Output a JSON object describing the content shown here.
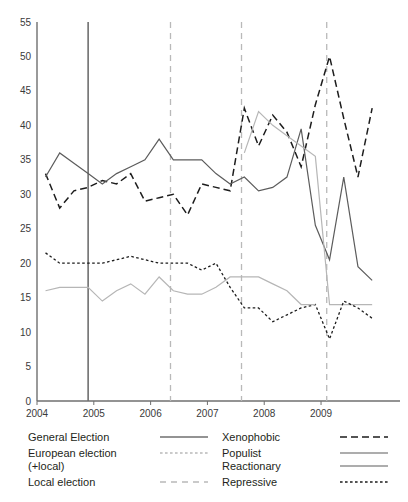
{
  "chart_data": {
    "type": "line",
    "title": "",
    "xlabel": "",
    "ylabel": "",
    "ylim": [
      0,
      55
    ],
    "xlim": [
      2004.0,
      2009.95
    ],
    "ytick_labels": [
      "0",
      "5",
      "10",
      "15",
      "20",
      "25",
      "30",
      "35",
      "40",
      "45",
      "50",
      "55"
    ],
    "ytick_values": [
      0,
      5,
      10,
      15,
      20,
      25,
      30,
      35,
      40,
      45,
      50,
      55
    ],
    "xtick_labels": [
      "2004",
      "2005",
      "2006",
      "2007",
      "2008",
      "2009"
    ],
    "xtick_values": [
      2004,
      2005,
      2006,
      2007,
      2008,
      2009
    ],
    "grid": false,
    "legend_position": "below-plot",
    "x": [
      2004.15,
      2004.4,
      2004.65,
      2004.9,
      2005.15,
      2005.4,
      2005.65,
      2005.9,
      2006.15,
      2006.4,
      2006.65,
      2006.9,
      2007.15,
      2007.4,
      2007.65,
      2007.9,
      2008.15,
      2008.4,
      2008.65,
      2008.9,
      2009.15,
      2009.4,
      2009.65,
      2009.9
    ],
    "series": [
      {
        "name": "Xenophobic",
        "style": "dashed",
        "color": "#1d1d1d",
        "values": [
          33.0,
          28.0,
          30.5,
          31.0,
          32.0,
          31.5,
          33.0,
          29.0,
          29.5,
          30.0,
          27.0,
          31.5,
          31.0,
          30.5,
          42.5,
          37.0,
          41.5,
          39.0,
          34.0,
          43.0,
          50.0,
          41.0,
          32.5,
          42.5
        ]
      },
      {
        "name": "Populist",
        "style": "solid",
        "color": "#5c5c5c",
        "values": [
          32.5,
          36.0,
          34.5,
          33.0,
          31.5,
          33.0,
          34.0,
          35.0,
          38.0,
          35.0,
          35.0,
          35.0,
          33.0,
          31.5,
          32.5,
          30.5,
          31.0,
          32.5,
          39.5,
          25.5,
          20.5,
          32.5,
          19.5,
          17.5
        ]
      },
      {
        "name": "Reactionary",
        "style": "solid-light",
        "color": "#b6b6b6",
        "values": [
          null,
          null,
          null,
          null,
          null,
          null,
          null,
          null,
          null,
          null,
          null,
          null,
          null,
          null,
          36.0,
          42.0,
          40.0,
          38.5,
          37.0,
          35.5,
          14.0,
          14.0,
          14.0,
          14.0
        ]
      },
      {
        "name": "Repressive",
        "style": "dotted",
        "color": "#1d1d1d",
        "values": [
          21.5,
          20.0,
          20.0,
          20.0,
          20.0,
          20.5,
          21.0,
          20.5,
          20.0,
          20.0,
          20.0,
          19.0,
          20.0,
          16.5,
          13.5,
          13.5,
          11.5,
          12.5,
          13.5,
          14.0,
          9.0,
          14.5,
          13.5,
          12.0
        ]
      },
      {
        "name": "Reactionary-low",
        "style": "solid-light",
        "color": "#b6b6b6",
        "values": [
          16.0,
          16.5,
          16.5,
          16.5,
          14.5,
          16.0,
          17.0,
          15.5,
          18.0,
          16.0,
          15.5,
          15.5,
          16.5,
          18.0,
          18.0,
          18.0,
          17.0,
          16.0,
          14.0,
          14.0,
          null,
          null,
          null,
          null
        ]
      }
    ],
    "event_lines": [
      {
        "name": "General Election",
        "x": 2004.9,
        "style": "solid"
      },
      {
        "name": "Local election",
        "x": 2006.35,
        "style": "dashed"
      },
      {
        "name": "Local election",
        "x": 2007.6,
        "style": "dashed"
      },
      {
        "name": "Local election",
        "x": 2009.1,
        "style": "dashed"
      }
    ]
  },
  "legend": {
    "left_column": [
      {
        "label": "General Election",
        "key": "general-election",
        "style": "solid"
      },
      {
        "label": "European election",
        "key": "european-election",
        "style": "dotted"
      },
      {
        "label": "(+local)",
        "key": "european-election-sub",
        "style": "none"
      },
      {
        "label": "Local election",
        "key": "local-election",
        "style": "dashed"
      }
    ],
    "right_column": [
      {
        "label": "Xenophobic",
        "key": "xenophobic",
        "style": "dashed"
      },
      {
        "label": "Populist",
        "key": "populist",
        "style": "solid"
      },
      {
        "label": "Reactionary",
        "key": "reactionary",
        "style": "solid"
      },
      {
        "label": "Repressive",
        "key": "repressive",
        "style": "dotted"
      }
    ]
  }
}
